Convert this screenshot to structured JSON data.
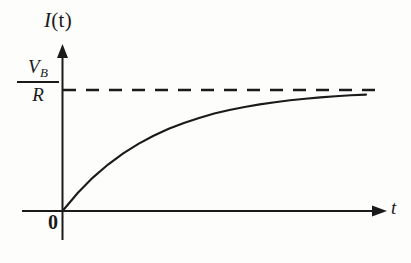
{
  "figure": {
    "y_axis_label_main": "I",
    "y_axis_label_arg": "(t)",
    "x_axis_label": "t",
    "origin_label": "0",
    "asymptote_numerator": "V",
    "asymptote_numerator_sub": "B",
    "asymptote_denominator": "R",
    "ink_color": "#1a1a1a",
    "background_color": "#fdfdfc"
  },
  "chart_data": {
    "type": "line",
    "title": "",
    "xlabel": "t",
    "ylabel": "I(t)",
    "xlim": [
      0,
      1
    ],
    "ylim": [
      0,
      1.12
    ],
    "grid": false,
    "legend": null,
    "annotations": [
      {
        "text": "V_B/R",
        "kind": "y-axis-tick-label",
        "y": 1.0
      },
      {
        "text": "0",
        "kind": "origin-label",
        "x": 0,
        "y": 0
      }
    ],
    "series": [
      {
        "name": "I(t) = (V_B/R)(1 - e^(-t/tau))",
        "style": "solid",
        "x": [
          0.0,
          0.05,
          0.1,
          0.15,
          0.2,
          0.25,
          0.3,
          0.35,
          0.4,
          0.45,
          0.5,
          0.55,
          0.6,
          0.65,
          0.7,
          0.75,
          0.8,
          0.85,
          0.9,
          0.95,
          1.0
        ],
        "y": [
          0.0,
          0.149,
          0.276,
          0.384,
          0.476,
          0.555,
          0.622,
          0.679,
          0.728,
          0.769,
          0.805,
          0.834,
          0.86,
          0.881,
          0.899,
          0.915,
          0.928,
          0.939,
          0.948,
          0.956,
          0.962
        ]
      },
      {
        "name": "asymptote V_B/R",
        "style": "dashed",
        "x": [
          0.0,
          1.0
        ],
        "y": [
          1.0,
          1.0
        ]
      }
    ]
  }
}
